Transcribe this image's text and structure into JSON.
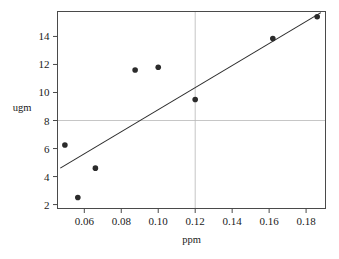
{
  "chart_data": {
    "type": "scatter",
    "title": "",
    "xlabel": "ppm",
    "ylabel": "ugm",
    "xlim": [
      0.0455,
      0.1905
    ],
    "ylim": [
      1.72,
      15.78
    ],
    "grid": true,
    "grid_lines": {
      "horizontal": [
        8
      ],
      "vertical": [
        0.12
      ]
    },
    "legend": null,
    "xticks": [
      0.06,
      0.08,
      0.1,
      0.12,
      0.14,
      0.16,
      0.18
    ],
    "xtick_labels": [
      "0.06",
      "0.08",
      "0.10",
      "0.12",
      "0.14",
      "0.16",
      "0.18"
    ],
    "yticks": [
      2,
      4,
      6,
      8,
      10,
      12,
      14
    ],
    "ytick_labels": [
      "2",
      "4",
      "6",
      "8",
      "10",
      "12",
      "14"
    ],
    "points": [
      {
        "x": 0.0495,
        "y": 6.25
      },
      {
        "x": 0.0565,
        "y": 2.5
      },
      {
        "x": 0.066,
        "y": 4.6
      },
      {
        "x": 0.0875,
        "y": 11.6
      },
      {
        "x": 0.1,
        "y": 11.8
      },
      {
        "x": 0.12,
        "y": 9.5
      },
      {
        "x": 0.162,
        "y": 13.85
      },
      {
        "x": 0.186,
        "y": 15.4
      }
    ],
    "series": [
      {
        "name": "observations",
        "marker": "filled-circle",
        "color": "#2b2b2b",
        "x": [
          0.0495,
          0.0565,
          0.066,
          0.0875,
          0.1,
          0.12,
          0.162,
          0.186
        ],
        "values": [
          6.25,
          2.5,
          4.6,
          11.6,
          11.8,
          9.5,
          13.85,
          15.4
        ]
      },
      {
        "name": "fit-line",
        "type": "line",
        "color": "#2a2a2a",
        "x": [
          0.047,
          0.188
        ],
        "values": [
          4.6,
          15.7
        ]
      }
    ],
    "fit_line": {
      "x_start": 0.047,
      "y_start": 4.6,
      "x_end": 0.188,
      "y_end": 15.7
    }
  }
}
